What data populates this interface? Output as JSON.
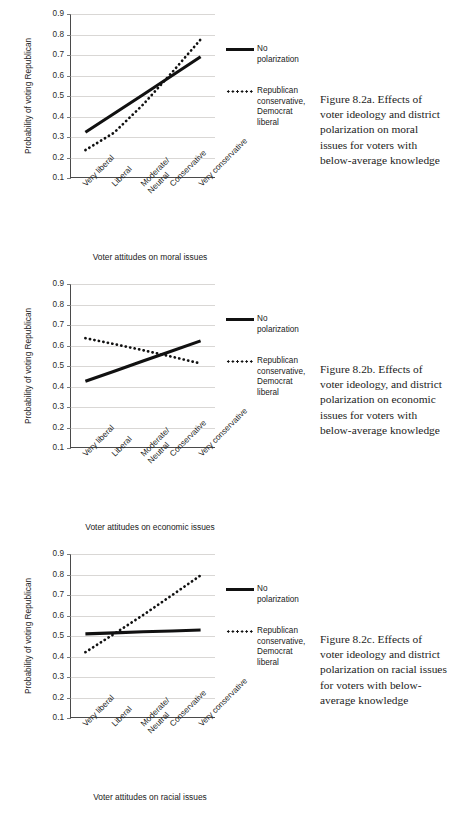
{
  "page": {
    "background": "#ffffff",
    "series_colors": {
      "solid": "#111111",
      "dotted": "#111111",
      "grid": "#d9d7d5",
      "axis": "#4a4a4a"
    }
  },
  "legend": {
    "solid_label": "No polarization",
    "dotted_label": "Republican conservative, Democrat liberal",
    "dotted_label_lines": [
      "Republican",
      "conservative,",
      "Democrat",
      "liberal"
    ]
  },
  "axis": {
    "y_title": "Probability of voting Republican",
    "y_ticks": [
      "0.9",
      "0.8",
      "0.7",
      "0.6",
      "0.5",
      "0.4",
      "0.3",
      "0.2",
      "0.1"
    ],
    "x_categories": [
      "Very liberal",
      "Liberal",
      "Moderate/ Neutral",
      "Conservative",
      "Very conservative"
    ]
  },
  "figures": [
    {
      "id": "8.2a",
      "x_title": "Voter attitudes on moral issues",
      "caption": "Figure 8.2a.  Effects of voter ideology and district polarization on moral issues for voters with below-average knowledge"
    },
    {
      "id": "8.2b",
      "x_title": "Voter attitudes on economic issues",
      "caption": "Figure 8.2b.  Effects of voter ideology, and district polarization on economic issues for voters with below-average knowledge"
    },
    {
      "id": "8.2c",
      "x_title": "Voter attitudes on racial issues",
      "caption": "Figure 8.2c.  Effects of voter ideology and district polarization on racial issues for voters with below-average knowledge"
    }
  ],
  "chart_data": [
    {
      "type": "line",
      "title": "Figure 8.2a",
      "xlabel": "Voter attitudes on moral issues",
      "ylabel": "Probability of voting Republican",
      "ylim": [
        0.1,
        0.9
      ],
      "yticks": [
        0.1,
        0.2,
        0.3,
        0.4,
        0.5,
        0.6,
        0.7,
        0.8,
        0.9
      ],
      "grid": true,
      "legend_position": "right",
      "categories": [
        "Very liberal",
        "Liberal",
        "Moderate/ Neutral",
        "Conservative",
        "Very conservative"
      ],
      "series": [
        {
          "name": "No polarization",
          "style": "solid",
          "values": [
            0.32,
            0.412,
            0.504,
            0.597,
            0.69
          ]
        },
        {
          "name": "Republican conservative, Democrat liberal",
          "style": "dotted",
          "values": [
            0.232,
            0.318,
            0.455,
            0.612,
            0.775
          ]
        }
      ]
    },
    {
      "type": "line",
      "title": "Figure 8.2b",
      "xlabel": "Voter attitudes on economic issues",
      "ylabel": "Probability of voting Republican",
      "ylim": [
        0.1,
        0.9
      ],
      "yticks": [
        0.1,
        0.2,
        0.3,
        0.4,
        0.5,
        0.6,
        0.7,
        0.8,
        0.9
      ],
      "grid": true,
      "legend_position": "right",
      "categories": [
        "Very liberal",
        "Liberal",
        "Moderate/ Neutral",
        "Conservative",
        "Very conservative"
      ],
      "series": [
        {
          "name": "No polarization",
          "style": "solid",
          "values": [
            0.423,
            0.472,
            0.522,
            0.571,
            0.621
          ]
        },
        {
          "name": "Republican conservative, Democrat liberal",
          "style": "dotted",
          "values": [
            0.634,
            0.605,
            0.575,
            0.543,
            0.51
          ]
        }
      ]
    },
    {
      "type": "line",
      "title": "Figure 8.2c",
      "xlabel": "Voter attitudes on racial issues",
      "ylabel": "Probability of voting Republican",
      "ylim": [
        0.1,
        0.9
      ],
      "yticks": [
        0.1,
        0.2,
        0.3,
        0.4,
        0.5,
        0.6,
        0.7,
        0.8,
        0.9
      ],
      "grid": true,
      "legend_position": "right",
      "categories": [
        "Very liberal",
        "Liberal",
        "Moderate/ Neutral",
        "Conservative",
        "Very conservative"
      ],
      "series": [
        {
          "name": "No polarization",
          "style": "solid",
          "values": [
            0.508,
            0.513,
            0.518,
            0.522,
            0.527
          ]
        },
        {
          "name": "Republican conservative, Democrat liberal",
          "style": "dotted",
          "values": [
            0.418,
            0.508,
            0.6,
            0.697,
            0.795
          ]
        }
      ]
    }
  ]
}
